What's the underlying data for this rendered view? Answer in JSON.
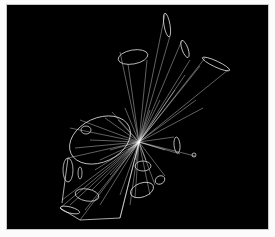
{
  "image": {
    "description": "Abstract wireframe rendering: many white outline cones/cylinders radiating from a central point on a black background",
    "background_color": "#000000",
    "line_color": "#ffffff",
    "frame_color": "#c8c8c8",
    "page_color": "#fbfbfb"
  }
}
